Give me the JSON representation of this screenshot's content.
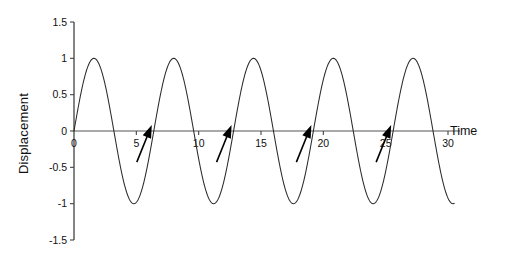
{
  "chart_data": {
    "type": "line",
    "title": "",
    "xlabel": "Time",
    "ylabel": "Displacement",
    "xlim": [
      0,
      30
    ],
    "ylim": [
      -1.5,
      1.5
    ],
    "grid": false,
    "legend": "none",
    "background_color": "#ffffff",
    "curve_color": "#2a2a2a",
    "axis_color": "#555555",
    "annotation_color": "#000000",
    "x_ticks": [
      0,
      5,
      10,
      15,
      20,
      25,
      30
    ],
    "x_tick_labels": [
      "0",
      "5",
      "10",
      "15",
      "20",
      "25",
      "30"
    ],
    "y_ticks": [
      1.5,
      1,
      0.5,
      0,
      -0.5,
      -1,
      -1.5
    ],
    "y_tick_labels": [
      "1.5",
      "1",
      "0.5",
      "0",
      "-0.5",
      "-1",
      "-1.5"
    ],
    "series": [
      {
        "name": "Displacement",
        "form": "sine",
        "amplitude": 1.0,
        "period": 6.4,
        "phase": 0,
        "x_start": 0,
        "x_end": 30.5,
        "peaks_x": [
          1.6,
          8.0,
          14.4,
          20.8,
          27.2
        ],
        "troughs_x": [
          4.8,
          11.2,
          17.6,
          24.0
        ],
        "zero_crossings_rising_x": [
          0,
          6.4,
          12.8,
          19.2,
          25.6
        ],
        "zero_crossings_falling_x": [
          3.2,
          9.6,
          16.0,
          22.4,
          28.8
        ]
      }
    ],
    "annotations": [
      {
        "label": "arrow",
        "points_to_x": 6.4,
        "points_to_y": 0,
        "direction": "up-right"
      },
      {
        "label": "arrow",
        "points_to_x": 12.8,
        "points_to_y": 0,
        "direction": "up-right"
      },
      {
        "label": "arrow",
        "points_to_x": 19.2,
        "points_to_y": 0,
        "direction": "up-right"
      },
      {
        "label": "arrow",
        "points_to_x": 25.6,
        "points_to_y": 0,
        "direction": "up-right"
      }
    ]
  }
}
